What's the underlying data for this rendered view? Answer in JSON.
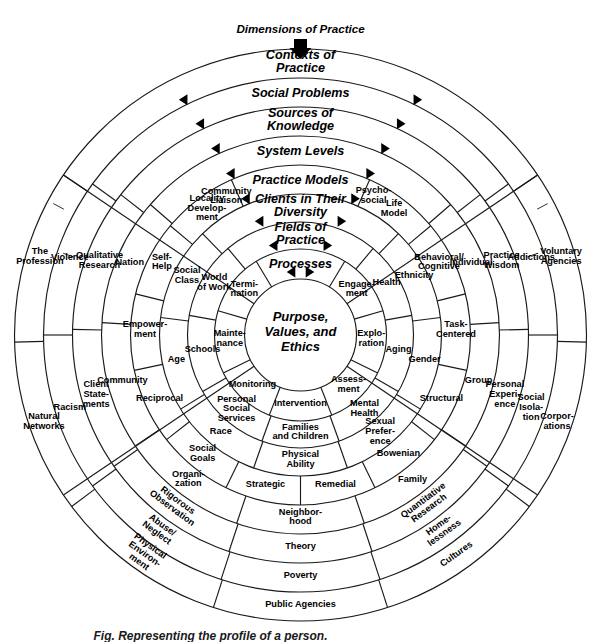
{
  "figure": {
    "title_arrow_label": "Dimensions of Practice",
    "caption": "Fig. Representing the profile of a person."
  },
  "core": {
    "lines": [
      "Purpose,",
      "Values, and",
      "Ethics"
    ]
  },
  "bands": [
    {
      "name": "processes",
      "lines": [
        "Processes"
      ]
    },
    {
      "name": "fields-of-practice",
      "lines": [
        "Fields of",
        "Practice"
      ]
    },
    {
      "name": "clients-in-their-diversity",
      "lines": [
        "Clients in Their",
        "Diversity"
      ]
    },
    {
      "name": "practice-models",
      "lines": [
        "Practice Models"
      ]
    },
    {
      "name": "system-levels",
      "lines": [
        "System Levels"
      ]
    },
    {
      "name": "sources-of-knowledge",
      "lines": [
        "Sources of",
        "Knowledge"
      ]
    },
    {
      "name": "social-problems",
      "lines": [
        "Social Problems"
      ]
    },
    {
      "name": "contexts-of-practice",
      "lines": [
        "Contexts of",
        "Practice"
      ]
    }
  ],
  "ring_items": {
    "processes": [
      {
        "lines": [
          "Engage-",
          "ment"
        ]
      },
      {
        "lines": [
          "Explo-",
          "ration"
        ]
      },
      {
        "lines": [
          "Assess-",
          "ment"
        ]
      },
      {
        "lines": [
          "Intervention"
        ]
      },
      {
        "lines": [
          "Monitoring"
        ]
      },
      {
        "lines": [
          "Mainte-",
          "nance"
        ]
      },
      {
        "lines": [
          "Termi-",
          "nation"
        ]
      }
    ],
    "fields_of_practice": [
      {
        "lines": [
          "Health"
        ]
      },
      {
        "lines": [
          "Aging"
        ]
      },
      {
        "lines": [
          "Mental",
          "Health"
        ]
      },
      {
        "lines": [
          "Families",
          "and Children"
        ]
      },
      {
        "lines": [
          "Personal",
          "Social",
          "Services"
        ]
      },
      {
        "lines": [
          "Schools"
        ]
      },
      {
        "lines": [
          "World",
          "of Work"
        ]
      }
    ],
    "clients_in_their_diversity": [
      {
        "lines": [
          "Ethnicity"
        ]
      },
      {
        "lines": [
          "Gender"
        ]
      },
      {
        "lines": [
          "Sexual",
          "Prefer-",
          "ence"
        ]
      },
      {
        "lines": [
          "Physical",
          "Ability"
        ]
      },
      {
        "lines": [
          "Race"
        ]
      },
      {
        "lines": [
          "Age"
        ]
      },
      {
        "lines": [
          "Social",
          "Class"
        ]
      }
    ],
    "practice_models": [
      {
        "lines": [
          "Life",
          "Model"
        ]
      },
      {
        "lines": [
          "Behavioral/",
          "Cognitive"
        ]
      },
      {
        "lines": [
          "Task-",
          "Centered"
        ]
      },
      {
        "lines": [
          "Structural"
        ]
      },
      {
        "lines": [
          "Bowenian"
        ]
      },
      {
        "lines": [
          "Remedial"
        ]
      },
      {
        "lines": [
          "Strategic"
        ]
      },
      {
        "lines": [
          "Social",
          "Goals"
        ]
      },
      {
        "lines": [
          "Reciprocal"
        ]
      },
      {
        "lines": [
          "Empower-",
          "ment"
        ]
      },
      {
        "lines": [
          "Self-",
          "Help"
        ]
      },
      {
        "lines": [
          "Locality",
          "Develop-",
          "ment"
        ]
      }
    ],
    "system_levels": [
      {
        "lines": [
          "Individual"
        ]
      },
      {
        "lines": [
          "Group"
        ]
      },
      {
        "lines": [
          "Family"
        ]
      },
      {
        "lines": [
          "Neighbor-",
          "hood"
        ]
      },
      {
        "lines": [
          "Organi-",
          "zation"
        ]
      },
      {
        "lines": [
          "Community"
        ]
      },
      {
        "lines": [
          "Nation"
        ]
      }
    ],
    "sources_of_knowledge": [
      {
        "lines": [
          "Practice",
          "Wisdom"
        ]
      },
      {
        "lines": [
          "Personal",
          "Experi-",
          "ence"
        ]
      },
      {
        "lines": [
          "Quantitative",
          "Research"
        ]
      },
      {
        "lines": [
          "Theory"
        ]
      },
      {
        "lines": [
          "Rigorous",
          "Observation"
        ]
      },
      {
        "lines": [
          "Client",
          "State-",
          "ments"
        ]
      },
      {
        "lines": [
          "Qualitative",
          "Research"
        ]
      }
    ],
    "social_problems": [
      {
        "lines": [
          "Addictions"
        ]
      },
      {
        "lines": [
          "Social",
          "Isola-",
          "tion"
        ]
      },
      {
        "lines": [
          "Home-",
          "lessness"
        ]
      },
      {
        "lines": [
          "Poverty"
        ]
      },
      {
        "lines": [
          "Abuse/",
          "Neglect"
        ]
      },
      {
        "lines": [
          "Racism"
        ]
      },
      {
        "lines": [
          "Violence"
        ]
      }
    ],
    "contexts_of_practice": [
      {
        "lines": [
          "Voluntary",
          "Agencies"
        ]
      },
      {
        "lines": [
          "Corpor-",
          "ations"
        ]
      },
      {
        "lines": [
          "Cultures"
        ]
      },
      {
        "lines": [
          "Public Agencies"
        ]
      },
      {
        "lines": [
          "Physical",
          "Environ-",
          "ment"
        ]
      },
      {
        "lines": [
          "Natural",
          "Networks"
        ]
      },
      {
        "lines": [
          "The",
          "Profession"
        ]
      }
    ],
    "psychosocial": [
      {
        "lines": [
          "Psycho-",
          "social"
        ]
      },
      {
        "lines": [
          "Community",
          "Liaison"
        ]
      }
    ]
  },
  "colors": {
    "line": "#1a1a1a",
    "text": "#000000",
    "background": "#ffffff"
  }
}
